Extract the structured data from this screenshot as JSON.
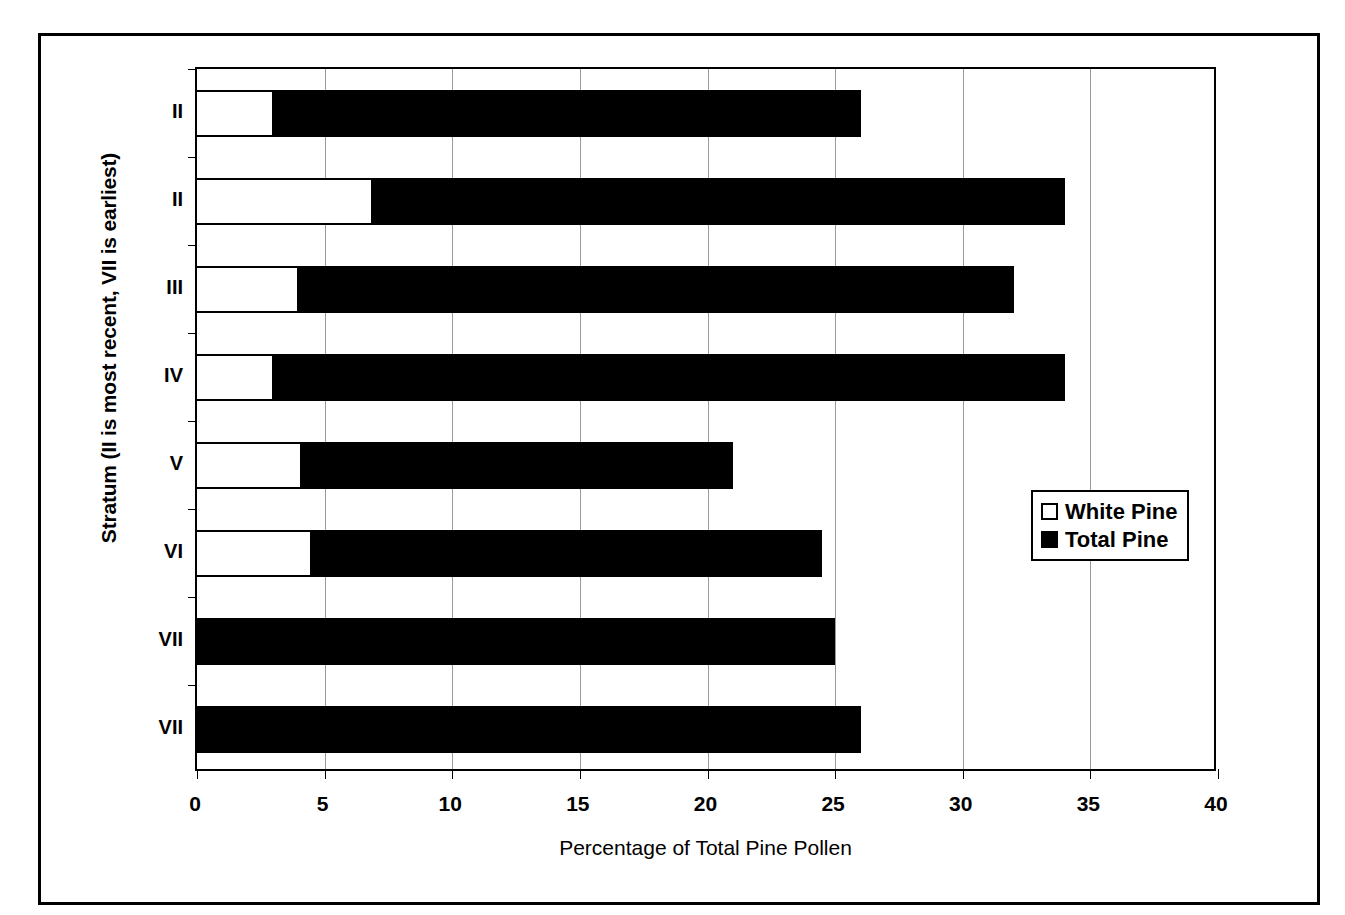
{
  "chart_data": {
    "type": "bar",
    "orientation": "horizontal",
    "title": "",
    "xlabel": "Percentage of Total Pine Pollen",
    "ylabel": "Stratum (II is most recent, VII is earliest)",
    "xlim": [
      0,
      40
    ],
    "xticks": [
      0,
      5,
      10,
      15,
      20,
      25,
      30,
      35,
      40
    ],
    "xticklabels": [
      "0",
      "5",
      "10",
      "15",
      "20",
      "25",
      "30",
      "35",
      "40"
    ],
    "categories": [
      "II",
      "II",
      "III",
      "IV",
      "V",
      "VI",
      "VII",
      "VII"
    ],
    "grid": "vertical",
    "legend_position": "right-middle",
    "series": [
      {
        "name": "White Pine",
        "color": "#ffffff",
        "edge_color": "#000000",
        "values": [
          3.0,
          6.9,
          4.0,
          3.0,
          4.1,
          4.5,
          0.0,
          0.0
        ]
      },
      {
        "name": "Total Pine",
        "color": "#000000",
        "edge_color": "#000000",
        "values": [
          26.0,
          34.0,
          32.0,
          34.0,
          21.0,
          24.5,
          25.0,
          26.0
        ]
      }
    ]
  },
  "legend": {
    "entries": [
      {
        "label": "White Pine",
        "swatch": "white-square-icon"
      },
      {
        "label": "Total Pine",
        "swatch": "black-square-icon"
      }
    ]
  },
  "axes": {
    "x_title": "Percentage of Total Pine Pollen",
    "y_title": "Stratum (II is most recent, VII is earliest)"
  },
  "caption": ""
}
